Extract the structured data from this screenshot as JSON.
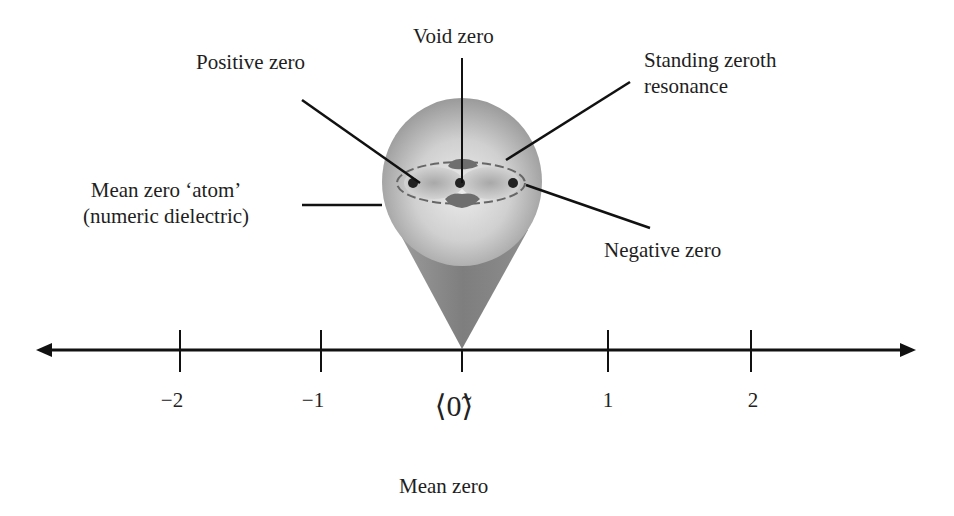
{
  "diagram": {
    "labels": {
      "positive_zero": "Positive zero",
      "void_zero": "Void zero",
      "standing_line1": "Standing zeroth",
      "standing_line2": "resonance",
      "atom_line1": "Mean zero ‘atom’",
      "atom_line2": "(numeric dielectric)",
      "negative_zero": "Negative zero",
      "mean_zero": "Mean zero"
    },
    "number_line": {
      "ticks": [
        {
          "value": -2,
          "label": "−2"
        },
        {
          "value": -1,
          "label": "−1"
        },
        {
          "value": 0,
          "label": ""
        },
        {
          "value": 1,
          "label": "1"
        },
        {
          "value": 2,
          "label": "2"
        }
      ],
      "zero_symbol": "⟨0̃⟩"
    },
    "colors": {
      "sphere_light": "#e0e0e0",
      "sphere_dark": "#8e8e8e",
      "cone": "#8a8a8a",
      "ink": "#111111"
    }
  }
}
